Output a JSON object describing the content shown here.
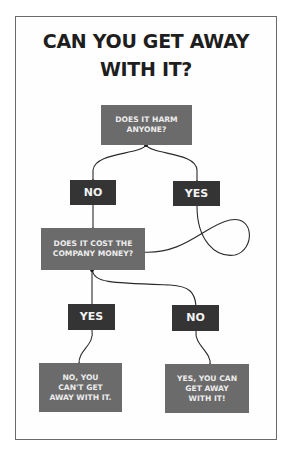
{
  "title": {
    "line1": "CAN YOU GET AWAY",
    "line2": "WITH IT?"
  },
  "nodes": {
    "q1": "DOES IT HARM ANYONE?",
    "q1_no": "NO",
    "q1_yes": "YES",
    "q2": "DOES IT COST THE COMPANY MONEY?",
    "q2_yes": "YES",
    "q2_no": "NO",
    "result_no": "NO, YOU CAN'T GET AWAY WITH IT.",
    "result_yes": "YES, YOU CAN GET AWAY WITH IT!"
  },
  "colors": {
    "question_box": "#6b6b6b",
    "answer_box": "#343434",
    "line": "#2a2a2a",
    "title": "#1e1e1e"
  }
}
